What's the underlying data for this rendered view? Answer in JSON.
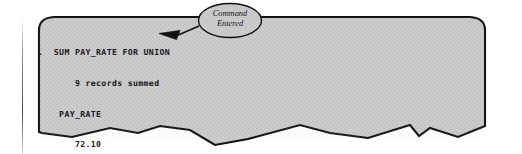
{
  "figure": {
    "kind": "terminal-screen-illustration",
    "caption_present": false
  },
  "screen": {
    "fill_color": "#c9c9c9",
    "border_color": "#111111",
    "page_color": "#ffffff",
    "torn_bottom_edge": true,
    "rounded_top_corners": true
  },
  "terminal": {
    "lines": [
      ".  SUM PAY_RATE FOR UNION",
      "       9 records summed",
      "    PAY_RATE",
      "       72.10",
      ".  _"
    ],
    "line_1": ".  SUM PAY_RATE FOR UNION",
    "line_2": "       9 records summed",
    "line_3": "    PAY_RATE",
    "line_4": "       72.10",
    "line_5": ".  _",
    "command": "SUM PAY_RATE FOR UNION",
    "prompt_char": ".",
    "cursor_char": "_",
    "record_count": 9,
    "record_message": "9 records summed",
    "column_header": "PAY_RATE",
    "column_value": "72.10",
    "text_color": "#17181a"
  },
  "callout": {
    "line_1": "Command",
    "line_2": "Entered",
    "full_text": "Command Entered",
    "shape": "ellipse",
    "has_leader_line": true,
    "arrowhead": "solid-triangle-left",
    "points_to": "SUM PAY_RATE FOR UNION"
  }
}
